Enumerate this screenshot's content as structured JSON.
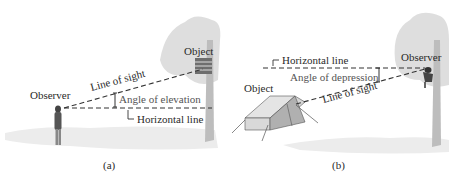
{
  "panels": [
    {
      "id": "a",
      "caption": "(a)",
      "labels": {
        "observer": "Observer",
        "object": "Object",
        "line_of_sight": "Line of sight",
        "angle": "Angle of elevation",
        "horizontal": "Horizontal line"
      }
    },
    {
      "id": "b",
      "caption": "(b)",
      "labels": {
        "observer": "Observer",
        "object": "Object",
        "line_of_sight": "Line of sight",
        "angle": "Angle of depression",
        "horizontal": "Horizontal line"
      }
    }
  ],
  "colors": {
    "text": "#2a2a2a",
    "line": "#333333",
    "foliage": "#dcdcdc",
    "trunk": "#b8b8b8",
    "ground": "#ececec"
  }
}
